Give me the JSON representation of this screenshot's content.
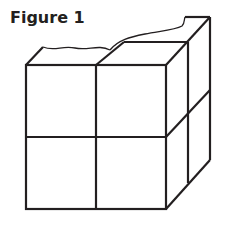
{
  "figure": {
    "title": "Figure 1",
    "stroke_color": "#231f20"
  }
}
